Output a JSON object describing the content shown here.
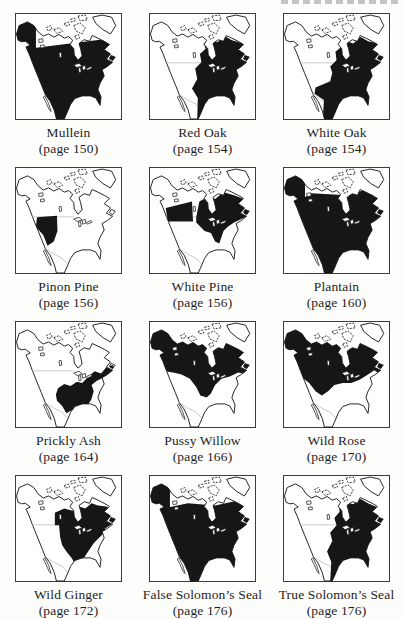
{
  "page": {
    "decorations": {
      "cropped_header": "illegible-text-fragment-cut-off-at-top-edge"
    },
    "colors": {
      "paper": "#fdfdfc",
      "ink_fill": "#161616",
      "outline": "#1a1a1a",
      "faint_border": "#999999",
      "frame": "#3c3c3c",
      "label_text": "#1d1d1d"
    }
  },
  "maps": [
    {
      "name": "Mullein",
      "page_label": "(page 150)",
      "range_id": "mullein"
    },
    {
      "name": "Red Oak",
      "page_label": "(page 154)",
      "range_id": "red-oak"
    },
    {
      "name": "White Oak",
      "page_label": "(page 154)",
      "range_id": "white-oak"
    },
    {
      "name": "Pinon Pine",
      "page_label": "(page 156)",
      "range_id": "pinon-pine"
    },
    {
      "name": "White Pine",
      "page_label": "(page 156)",
      "range_id": "white-pine"
    },
    {
      "name": "Plantain",
      "page_label": "(page 160)",
      "range_id": "plantain"
    },
    {
      "name": "Prickly Ash",
      "page_label": "(page 164)",
      "range_id": "prickly-ash"
    },
    {
      "name": "Pussy Willow",
      "page_label": "(page 166)",
      "range_id": "pussy-willow"
    },
    {
      "name": "Wild Rose",
      "page_label": "(page 170)",
      "range_id": "wild-rose"
    },
    {
      "name": "Wild Ginger",
      "page_label": "(page 172)",
      "range_id": "wild-ginger"
    },
    {
      "name": "False Solomon’s Seal",
      "page_label": "(page 176)",
      "range_id": "false-solomons-seal"
    },
    {
      "name": "True Solomon’s Seal",
      "page_label": "(page 176)",
      "range_id": "true-solomons-seal"
    }
  ]
}
